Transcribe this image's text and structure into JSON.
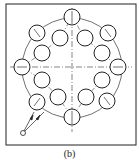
{
  "caption": "(b)",
  "diagram": {
    "frame": {
      "x": 6,
      "y": 4,
      "w": 130,
      "h": 141
    },
    "center": {
      "x": 72,
      "y": 68
    },
    "pitch_circle_radius": 50,
    "outer_holes": [
      [
        72,
        17
      ],
      [
        37,
        33
      ],
      [
        108,
        33
      ],
      [
        22,
        67
      ],
      [
        118,
        67
      ],
      [
        37,
        102
      ],
      [
        107,
        101
      ],
      [
        72,
        117
      ]
    ],
    "inner_holes": [
      [
        60,
        38
      ],
      [
        85,
        38
      ],
      [
        42,
        53
      ],
      [
        102,
        53
      ],
      [
        42,
        80
      ],
      [
        102,
        80
      ],
      [
        58,
        97
      ],
      [
        86,
        97
      ]
    ],
    "hole_radius": 8,
    "start_point": [
      23,
      133
    ],
    "colors": {
      "line": "#222222",
      "background": "#ffffff"
    }
  }
}
